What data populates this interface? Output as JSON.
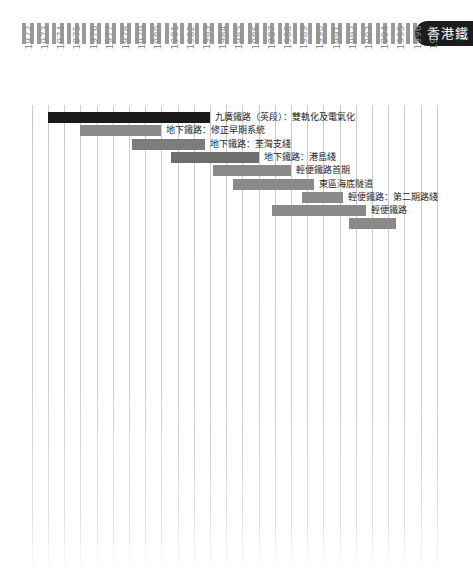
{
  "header": {
    "badge_text": "香港鐵",
    "stripe_count": 57,
    "stripe_color": "#9a9a9a",
    "badge_color": "#1c1c1c"
  },
  "chart_data": {
    "type": "bar",
    "orientation": "horizontal-gantt",
    "xlabel": "",
    "ylabel": "",
    "grid": true,
    "legend": "none",
    "xlim": [
      1972,
      1997
    ],
    "categories": [
      "1972",
      "1973",
      "1974",
      "1975",
      "1976",
      "1977",
      "1978",
      "1979",
      "1980",
      "1981",
      "1982",
      "1983",
      "1984",
      "1985",
      "1986",
      "1987",
      "1988",
      "1989",
      "1990",
      "1991",
      "1992",
      "1993",
      "1994",
      "1995",
      "1996",
      "1997"
    ],
    "tasks": [
      {
        "label": "九廣鐵路（英段）：雙軌化及電氣化",
        "start": 1973.0,
        "end": 1983.0,
        "color": "#1a1a1a"
      },
      {
        "label": "地下鐵路：修正早期系統",
        "start": 1975.0,
        "end": 1980.0,
        "color": "#8a8a8a"
      },
      {
        "label": "地下鐵路：荃灣支綫",
        "start": 1978.2,
        "end": 1982.7,
        "color": "#7c7c7c"
      },
      {
        "label": "地下鐵路：港島綫",
        "start": 1980.6,
        "end": 1986.0,
        "color": "#6e6e6e"
      },
      {
        "label": "輕便鐵路首期",
        "start": 1983.2,
        "end": 1988.0,
        "color": "#8a8a8a"
      },
      {
        "label": "東區海底隧道",
        "start": 1984.4,
        "end": 1989.4,
        "color": "#8a8a8a"
      },
      {
        "label": "輕便鐵路：第二期路綫",
        "start": 1988.7,
        "end": 1991.2,
        "color": "#8a8a8a"
      },
      {
        "label": "輕便鐵路",
        "start": 1986.8,
        "end": 1992.6,
        "color": "#8a8a8a"
      },
      {
        "label": "",
        "start": 1991.6,
        "end": 1994.5,
        "color": "#8a8a8a"
      }
    ]
  }
}
